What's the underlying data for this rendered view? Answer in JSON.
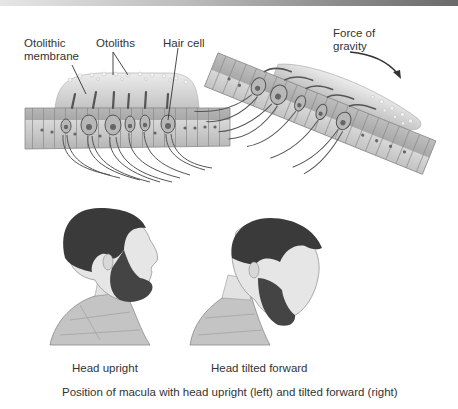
{
  "figure": {
    "panel_upright_macula": {
      "labels": {
        "otolithic_membrane_line1": "Otolithic",
        "otolithic_membrane_line2": "membrane",
        "otoliths": "Otoliths",
        "hair_cell": "Hair cell"
      }
    },
    "panel_tilted_macula": {
      "labels": {
        "force_line1": "Force of",
        "force_line2": "gravity"
      }
    },
    "heads": {
      "upright_caption": "Head upright",
      "tilted_caption": "Head tilted forward"
    },
    "caption": "Position of macula with head upright (left) and tilted forward (right)"
  },
  "colors": {
    "line": "#3a3a3a",
    "tissue": "#c9c9c9",
    "tissue_dark": "#9a9a9a",
    "membrane": "#dcdcdc",
    "hair": "#3b3b3b",
    "skin": "#e4e4e4",
    "shirt": "#bdbdbd"
  }
}
